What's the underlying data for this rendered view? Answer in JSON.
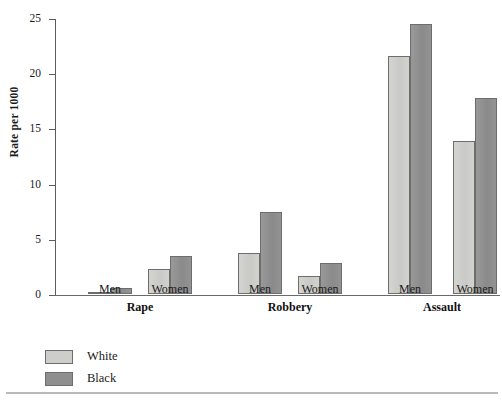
{
  "chart": {
    "type": "bar",
    "ylabel": "Rate per 1000",
    "ytick_labels": [
      "0",
      "5",
      "10",
      "15",
      "20",
      "25"
    ]
  },
  "legend": {
    "position": "bottom-left",
    "items": [
      {
        "label": "White",
        "color": "#cdcdc9",
        "key": "white"
      },
      {
        "label": "Black",
        "color": "#8f8f8f",
        "key": "black"
      }
    ]
  },
  "groups": [
    {
      "label": "Rape",
      "subgroups": [
        {
          "label": "Men",
          "white": 0.2,
          "black": 0.5
        },
        {
          "label": "Women",
          "white": 2.3,
          "black": 3.4
        }
      ]
    },
    {
      "label": "Robbery",
      "subgroups": [
        {
          "label": "Men",
          "white": 3.7,
          "black": 7.4
        },
        {
          "label": "Women",
          "white": 1.6,
          "black": 2.8
        }
      ]
    },
    {
      "label": "Assault",
      "subgroups": [
        {
          "label": "Men",
          "white": 21.6,
          "black": 24.5
        },
        {
          "label": "Women",
          "white": 13.9,
          "black": 17.8
        }
      ]
    }
  ],
  "chart_data": {
    "type": "bar",
    "title": "",
    "xlabel": "",
    "ylabel": "Rate per 1000",
    "ylim": [
      0,
      25
    ],
    "yticks": [
      0,
      5,
      10,
      15,
      20,
      25
    ],
    "grid": false,
    "legend_position": "bottom-left",
    "categories": [
      "Rape - Men",
      "Rape - Women",
      "Robbery - Men",
      "Robbery - Women",
      "Assault - Men",
      "Assault - Women"
    ],
    "group_labels": [
      "Rape",
      "Robbery",
      "Assault"
    ],
    "subgroup_labels": [
      "Men",
      "Women"
    ],
    "series": [
      {
        "name": "White",
        "color": "#cdcdc9",
        "values": [
          0.2,
          2.3,
          3.7,
          1.6,
          21.6,
          13.9
        ]
      },
      {
        "name": "Black",
        "color": "#8f8f8f",
        "values": [
          0.5,
          3.4,
          7.4,
          2.8,
          24.5,
          17.8
        ]
      }
    ]
  }
}
